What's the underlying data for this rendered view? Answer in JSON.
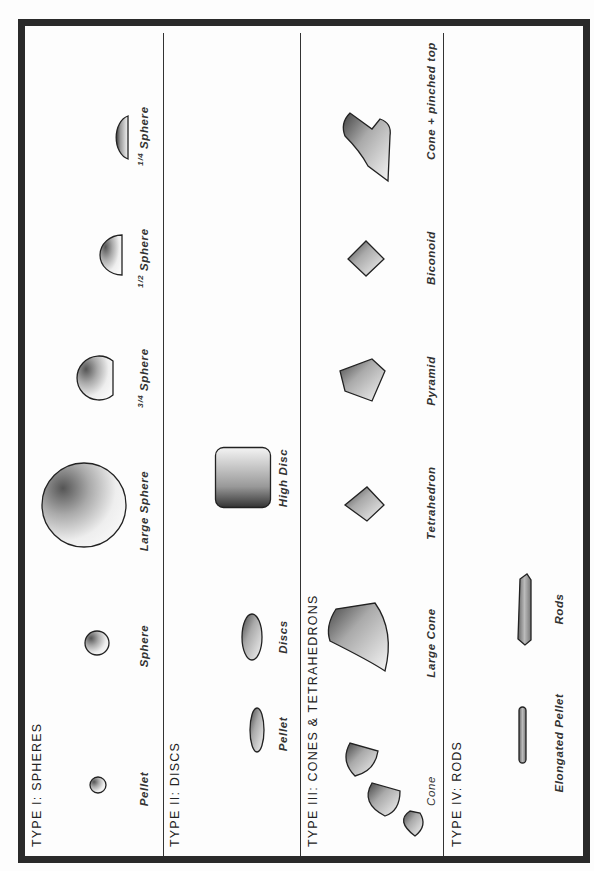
{
  "diagram": {
    "orientation": "rotated 90 degrees counter-clockwise",
    "sections": [
      {
        "title": "TYPE I:  SPHERES",
        "items": [
          {
            "label": "Pellet"
          },
          {
            "label": "Sphere"
          },
          {
            "label": "Large  Sphere"
          },
          {
            "label_frac": "3/4",
            "label": "Sphere"
          },
          {
            "label_frac": "1/2",
            "label": "Sphere"
          },
          {
            "label_frac": "1/4",
            "label": "Sphere"
          }
        ]
      },
      {
        "title": "TYPE II:  DISCS",
        "items": [
          {
            "label": "Pellet"
          },
          {
            "label": "Discs"
          },
          {
            "label": "High  Disc"
          }
        ]
      },
      {
        "title": "TYPE III:  CONES & TETRAHEDRONS",
        "items": [
          {
            "label": "Cone"
          },
          {
            "label": "Large  Cone"
          },
          {
            "label": "Tetrahedron"
          },
          {
            "label": "Pyramid"
          },
          {
            "label": "Biconoid"
          },
          {
            "label": "Cone + pinched  top"
          }
        ]
      },
      {
        "title": "TYPE IV: RODS",
        "items": [
          {
            "label": "Elongated  Pellet"
          },
          {
            "label": "Rods"
          }
        ]
      }
    ],
    "colors": {
      "ink": "#222222",
      "paper": "#fdfdfd",
      "border": "#2a2a2a"
    }
  }
}
